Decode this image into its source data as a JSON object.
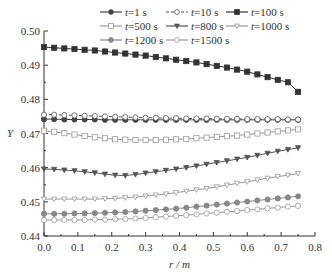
{
  "chart_data": {
    "type": "line",
    "title": "",
    "xlabel": "r / m",
    "ylabel": "Y",
    "xlim": [
      0.0,
      0.8
    ],
    "ylim": [
      0.44,
      0.5
    ],
    "xticks": [
      "0.0",
      "0.1",
      "0.2",
      "0.3",
      "0.4",
      "0.5",
      "0.6",
      "0.7",
      "0.8"
    ],
    "yticks": [
      "0.44",
      "0.45",
      "0.46",
      "0.47",
      "0.48",
      "0.49",
      "0.50"
    ],
    "grid": false,
    "legend_position": "top",
    "x": [
      0.0,
      0.03,
      0.06,
      0.09,
      0.12,
      0.15,
      0.18,
      0.21,
      0.24,
      0.27,
      0.3,
      0.33,
      0.36,
      0.39,
      0.42,
      0.45,
      0.48,
      0.51,
      0.54,
      0.57,
      0.6,
      0.63,
      0.66,
      0.69,
      0.72,
      0.75
    ],
    "series": [
      {
        "name": "t=1 s",
        "marker": "filled-circle",
        "line": "solid",
        "color": "#444444",
        "values": [
          0.4742,
          0.4742,
          0.4741,
          0.4741,
          0.4741,
          0.4741,
          0.474,
          0.474,
          0.474,
          0.474,
          0.474,
          0.474,
          0.474,
          0.474,
          0.474,
          0.474,
          0.474,
          0.474,
          0.474,
          0.474,
          0.474,
          0.474,
          0.474,
          0.474,
          0.474,
          0.474
        ]
      },
      {
        "name": "t=10 s",
        "marker": "open-circle",
        "line": "dashed",
        "color": "#555555",
        "values": [
          0.4755,
          0.4755,
          0.4754,
          0.4753,
          0.4752,
          0.4751,
          0.475,
          0.4749,
          0.4748,
          0.4747,
          0.4746,
          0.4746,
          0.4745,
          0.4745,
          0.4744,
          0.4744,
          0.4744,
          0.4743,
          0.4743,
          0.4743,
          0.4742,
          0.4742,
          0.4742,
          0.4742,
          0.4741,
          0.4741
        ]
      },
      {
        "name": "t=100 s",
        "marker": "filled-square",
        "line": "solid",
        "color": "#333333",
        "values": [
          0.4953,
          0.4951,
          0.4949,
          0.4947,
          0.4945,
          0.4943,
          0.494,
          0.4937,
          0.4934,
          0.4931,
          0.4928,
          0.4924,
          0.492,
          0.4916,
          0.4912,
          0.4908,
          0.4903,
          0.4898,
          0.4893,
          0.4887,
          0.4881,
          0.4873,
          0.4865,
          0.4857,
          0.485,
          0.4822
        ]
      },
      {
        "name": "t=500 s",
        "marker": "open-square",
        "line": "solid",
        "color": "#999999",
        "values": [
          0.4708,
          0.4705,
          0.4701,
          0.4697,
          0.4693,
          0.4689,
          0.4686,
          0.4683,
          0.4682,
          0.4681,
          0.4681,
          0.4681,
          0.4682,
          0.4683,
          0.4684,
          0.4686,
          0.4688,
          0.469,
          0.4692,
          0.4694,
          0.4697,
          0.47,
          0.4703,
          0.4706,
          0.4709,
          0.4712
        ]
      },
      {
        "name": "t=800 s",
        "marker": "filled-triangle-down",
        "line": "solid",
        "color": "#555555",
        "values": [
          0.4596,
          0.4595,
          0.4593,
          0.4591,
          0.4588,
          0.4585,
          0.4581,
          0.4578,
          0.4577,
          0.458,
          0.4584,
          0.4588,
          0.4592,
          0.4596,
          0.46,
          0.4605,
          0.461,
          0.4615,
          0.462,
          0.4625,
          0.463,
          0.4636,
          0.4642,
          0.4648,
          0.4653,
          0.4658
        ]
      },
      {
        "name": "t=1000 s",
        "marker": "open-triangle-down",
        "line": "solid",
        "color": "#999999",
        "values": [
          0.4508,
          0.4508,
          0.4508,
          0.4508,
          0.4508,
          0.4508,
          0.4509,
          0.451,
          0.4512,
          0.4514,
          0.4517,
          0.452,
          0.4523,
          0.4527,
          0.4531,
          0.4535,
          0.4539,
          0.4544,
          0.4549,
          0.4554,
          0.4559,
          0.4564,
          0.4569,
          0.4574,
          0.4578,
          0.4583
        ]
      },
      {
        "name": "t=1200 s",
        "marker": "filled-circle",
        "line": "solid",
        "color": "#888888",
        "values": [
          0.4465,
          0.4465,
          0.4465,
          0.4466,
          0.4466,
          0.4467,
          0.4468,
          0.4469,
          0.447,
          0.4472,
          0.4474,
          0.4476,
          0.4478,
          0.448,
          0.4483,
          0.4486,
          0.4489,
          0.4492,
          0.4495,
          0.4498,
          0.4501,
          0.4504,
          0.4507,
          0.451,
          0.4513,
          0.4516
        ]
      },
      {
        "name": "t=1500 s",
        "marker": "open-circle",
        "line": "solid",
        "color": "#999999",
        "values": [
          0.4447,
          0.4447,
          0.4447,
          0.4447,
          0.4447,
          0.4448,
          0.4448,
          0.4449,
          0.445,
          0.4451,
          0.4453,
          0.4455,
          0.4457,
          0.4459,
          0.4461,
          0.4463,
          0.4466,
          0.4468,
          0.4471,
          0.4473,
          0.4476,
          0.4478,
          0.4481,
          0.4483,
          0.4486,
          0.4488
        ]
      }
    ]
  }
}
